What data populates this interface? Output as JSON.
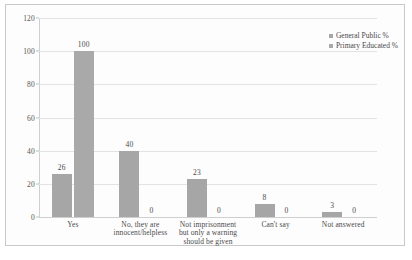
{
  "chart_data": {
    "type": "bar",
    "title": "",
    "xlabel": "",
    "ylabel": "",
    "ylim": [
      0,
      120
    ],
    "ytick_values": [
      0,
      20,
      40,
      60,
      80,
      100,
      120
    ],
    "ytick_labels": [
      "0",
      "20",
      "40",
      "60",
      "80",
      "100",
      "120"
    ],
    "grid": true,
    "legend_position": "top-right",
    "categories": [
      "Yes",
      "No, they are innocent/helpless",
      "Not imprisonment but only a warning should be given",
      "Can't say",
      "Not answered"
    ],
    "category_lines": [
      [
        "Yes"
      ],
      [
        "No, they are",
        "innocent/helpless"
      ],
      [
        "Not imprisonment",
        "but only a warning",
        "should be given"
      ],
      [
        "Can't say"
      ],
      [
        "Not answered"
      ]
    ],
    "series": [
      {
        "name": "General Public %",
        "color": "#a6a6a6",
        "values": [
          26,
          40,
          23,
          8,
          3
        ],
        "labels": [
          "26",
          "40",
          "23",
          "8",
          "3"
        ]
      },
      {
        "name": "Primary Educated %",
        "color": "#a9a9a9",
        "values": [
          100,
          0,
          0,
          0,
          0
        ],
        "labels": [
          "100",
          "0",
          "0",
          "0",
          "0"
        ]
      }
    ]
  }
}
